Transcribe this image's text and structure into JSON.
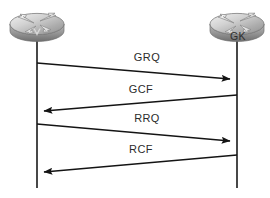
{
  "diagram": {
    "type": "sequence-diagram",
    "background_color": "#ffffff",
    "line_color": "#1a1a1a",
    "nodes": [
      {
        "id": "gateway",
        "icon": "router-icon",
        "label": "V",
        "lifeline_x": 37,
        "label_x": 37,
        "label_y": 30
      },
      {
        "id": "gatekeeper",
        "icon": "router-icon",
        "label": "GK",
        "lifeline_x": 237,
        "label_x": 238,
        "label_y": 30
      }
    ],
    "messages": [
      {
        "label": "GRQ",
        "direction": "left-to-right",
        "from": "gateway",
        "to": "gatekeeper",
        "start_y": 63,
        "end_y": 79,
        "label_x": 147,
        "label_y": 53
      },
      {
        "label": "GCF",
        "direction": "right-to-left",
        "from": "gatekeeper",
        "to": "gateway",
        "start_y": 95,
        "end_y": 111,
        "label_x": 141,
        "label_y": 85
      },
      {
        "label": "RRQ",
        "direction": "left-to-right",
        "from": "gateway",
        "to": "gatekeeper",
        "start_y": 124,
        "end_y": 141,
        "label_x": 147,
        "label_y": 114
      },
      {
        "label": "RCF",
        "direction": "right-to-left",
        "from": "gatekeeper",
        "to": "gateway",
        "start_y": 155,
        "end_y": 172,
        "label_x": 141,
        "label_y": 145
      }
    ],
    "lifeline_top": 38,
    "lifeline_bottom": 188
  }
}
